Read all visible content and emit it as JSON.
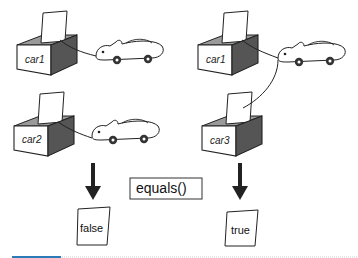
{
  "diagram": {
    "left_column": {
      "top_box": {
        "label": "car1"
      },
      "bottom_box": {
        "label": "car2"
      },
      "result": "false"
    },
    "right_column": {
      "top_box": {
        "label": "car1"
      },
      "bottom_box": {
        "label": "car3"
      },
      "result": "true"
    },
    "method_label": "equals()",
    "colors": {
      "box_side_dark": "#555555",
      "box_inner": "#9a9a9a",
      "arrow": "#222222",
      "footer_accent": "#2b7bb9",
      "footer_rule": "#cccccc"
    }
  }
}
